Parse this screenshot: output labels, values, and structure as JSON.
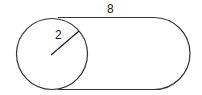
{
  "diagram": {
    "type": "geometry",
    "labels": {
      "radius": "2",
      "length": "8"
    },
    "colors": {
      "stroke": "#333333",
      "background": "#ffffff"
    }
  }
}
